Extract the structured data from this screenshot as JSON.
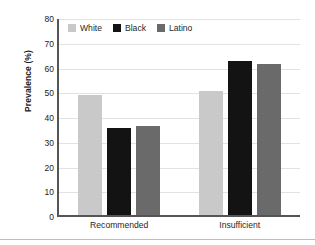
{
  "chart_data": {
    "type": "bar",
    "title": "",
    "subtitle": "",
    "xlabel": "",
    "ylabel": "Prevalence (%)",
    "categories": [
      "Recommended",
      "Insufficient"
    ],
    "series": [
      {
        "name": "White",
        "color": "#c9c9c9",
        "values": [
          49.0,
          50.5
        ]
      },
      {
        "name": "Black",
        "color": "#131313",
        "values": [
          35.5,
          63.0
        ]
      },
      {
        "name": "Latino",
        "color": "#6a6a6a",
        "values": [
          36.5,
          61.5
        ]
      }
    ],
    "ylim": [
      0,
      80
    ],
    "yticks": [
      0,
      10,
      20,
      30,
      40,
      50,
      60,
      70,
      80
    ],
    "ytick_labels": [
      "0",
      "10",
      "20",
      "30",
      "40",
      "50",
      "60",
      "70",
      "80"
    ],
    "grid": "horizontal",
    "legend_position": "top-left-inside"
  }
}
